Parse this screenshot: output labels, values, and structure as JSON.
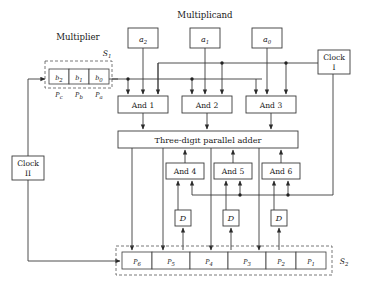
{
  "figure": {
    "labels": {
      "multiplicand": "Multiplicand",
      "multiplier": "Multiplier",
      "register_s1": "S",
      "register_s1_sub": "1",
      "register_s2": "S",
      "register_s2_sub": "2"
    }
  },
  "multiplicand_boxes": [
    {
      "name": "a2",
      "base": "a",
      "sub": "2",
      "x": 128,
      "y": 28,
      "w": 30,
      "h": 20
    },
    {
      "name": "a1",
      "base": "a",
      "sub": "1",
      "x": 190,
      "y": 28,
      "w": 30,
      "h": 20
    },
    {
      "name": "a0",
      "base": "a",
      "sub": "0",
      "x": 252,
      "y": 28,
      "w": 30,
      "h": 20
    }
  ],
  "multiplier_cells": [
    {
      "name": "b2",
      "base": "b",
      "sub": "2",
      "under": "P",
      "under_sub": "c"
    },
    {
      "name": "b1",
      "base": "b",
      "sub": "1",
      "under": "P",
      "under_sub": "b"
    },
    {
      "name": "b0",
      "base": "b",
      "sub": "0",
      "under": "P",
      "under_sub": "a"
    }
  ],
  "and_gates_top": [
    {
      "label": "And  1",
      "x": 118,
      "y": 96,
      "w": 50,
      "h": 17
    },
    {
      "label": "And  2",
      "x": 182,
      "y": 96,
      "w": 50,
      "h": 17
    },
    {
      "label": "And  3",
      "x": 246,
      "y": 96,
      "w": 50,
      "h": 17
    }
  ],
  "and_gates_bottom": [
    {
      "label": "And  4",
      "x": 166,
      "y": 163,
      "w": 38,
      "h": 16
    },
    {
      "label": "And  5",
      "x": 214,
      "y": 163,
      "w": 38,
      "h": 16
    },
    {
      "label": "And  6",
      "x": 262,
      "y": 163,
      "w": 38,
      "h": 16
    }
  ],
  "delay_boxes": [
    {
      "label": "D",
      "x": 175,
      "y": 210,
      "w": 16,
      "h": 16
    },
    {
      "label": "D",
      "x": 223,
      "y": 210,
      "w": 16,
      "h": 16
    },
    {
      "label": "D",
      "x": 271,
      "y": 210,
      "w": 16,
      "h": 16
    }
  ],
  "adder": {
    "label": "Three-digit  parallel  adder",
    "x": 118,
    "y": 131,
    "w": 180,
    "h": 17
  },
  "clocks": [
    {
      "line1": "Clock",
      "line2": "I",
      "x": 318,
      "y": 50,
      "w": 32,
      "h": 24
    },
    {
      "line1": "Clock",
      "line2": "II",
      "x": 12,
      "y": 156,
      "w": 32,
      "h": 24
    }
  ],
  "product_register": {
    "cells": [
      {
        "base": "P",
        "sub": "6",
        "x": 122,
        "w": 30
      },
      {
        "base": "P",
        "sub": "5",
        "x": 152,
        "w": 38
      },
      {
        "base": "P",
        "sub": "4",
        "x": 190,
        "w": 38
      },
      {
        "base": "P",
        "sub": "3",
        "x": 228,
        "w": 38
      },
      {
        "base": "P",
        "sub": "2",
        "x": 266,
        "w": 30
      },
      {
        "base": "P",
        "sub": "1",
        "x": 296,
        "w": 30
      }
    ],
    "y": 252,
    "h": 17
  }
}
